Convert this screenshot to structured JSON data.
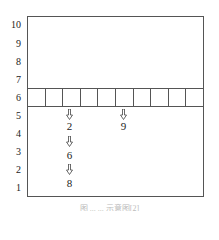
{
  "y_axis": {
    "labels": [
      "10",
      "9",
      "8",
      "7",
      "6",
      "5",
      "4",
      "3",
      "2",
      "1"
    ]
  },
  "grid": {
    "row_level": "6",
    "cell_count": 10
  },
  "columns": [
    {
      "column_index": 2,
      "sequence": [
        "2",
        "6",
        "8"
      ]
    },
    {
      "column_index": 5,
      "sequence": [
        "9"
      ]
    }
  ],
  "caption": {
    "text": "图 ... ... 示意图[2]"
  },
  "colors": {
    "line": "#555555",
    "text": "#222222",
    "background": "#ffffff"
  }
}
